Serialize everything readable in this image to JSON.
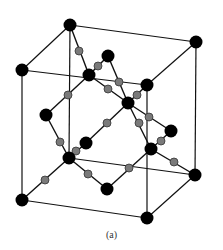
{
  "figure": {
    "caption": "(a)",
    "colors": {
      "background": "#ffffff",
      "edge": "#111111",
      "atom_large": "#000000",
      "atom_small": "#7a7a7a",
      "atom_small_stroke": "#333333"
    },
    "cube_corners": {
      "top_back_left": [
        70,
        25
      ],
      "top_back_right": [
        196,
        42
      ],
      "top_front_left": [
        22,
        70
      ],
      "top_front_right": [
        147,
        85
      ],
      "bottom_back_left": [
        69,
        158
      ],
      "bottom_back_right": [
        195,
        175
      ],
      "bottom_front_left": [
        22,
        200
      ],
      "bottom_front_right": [
        147,
        218
      ]
    },
    "cube_edges": [
      [
        "top_back_left",
        "top_back_right"
      ],
      [
        "top_back_left",
        "top_front_left"
      ],
      [
        "top_back_right",
        "top_front_right"
      ],
      [
        "top_front_left",
        "top_front_right"
      ],
      [
        "bottom_back_left",
        "bottom_back_right"
      ],
      [
        "bottom_front_left",
        "bottom_front_right"
      ],
      [
        "bottom_back_right",
        "bottom_front_right"
      ],
      [
        "top_back_left",
        "bottom_back_left"
      ],
      [
        "top_back_right",
        "bottom_back_right"
      ],
      [
        "top_front_left",
        "bottom_front_left"
      ],
      [
        "top_front_right",
        "bottom_front_right"
      ]
    ],
    "large_atoms": [
      [
        70,
        25
      ],
      [
        196,
        42
      ],
      [
        22,
        70
      ],
      [
        147,
        85
      ],
      [
        22,
        200
      ],
      [
        147,
        218
      ],
      [
        195,
        175
      ],
      [
        69,
        158
      ],
      [
        108,
        56
      ],
      [
        89,
        75
      ],
      [
        46,
        115
      ],
      [
        128,
        103
      ],
      [
        171,
        131
      ],
      [
        86,
        143
      ],
      [
        151,
        149
      ],
      [
        107,
        189
      ]
    ],
    "bonds": [
      {
        "from": [
          70,
          25
        ],
        "to": [
          89,
          75
        ],
        "mid": [
          79,
          51
        ]
      },
      {
        "from": [
          108,
          56
        ],
        "to": [
          89,
          75
        ],
        "mid": [
          98,
          66
        ]
      },
      {
        "from": [
          89,
          75
        ],
        "to": [
          46,
          115
        ],
        "mid": [
          68,
          95
        ]
      },
      {
        "from": [
          89,
          75
        ],
        "to": [
          128,
          103
        ],
        "mid": [
          108,
          89
        ]
      },
      {
        "from": [
          108,
          56
        ],
        "to": [
          128,
          103
        ],
        "mid": [
          119,
          82
        ]
      },
      {
        "from": [
          147,
          85
        ],
        "to": [
          128,
          103
        ],
        "mid": [
          137,
          95
        ]
      },
      {
        "from": [
          128,
          103
        ],
        "to": [
          171,
          131
        ],
        "mid": [
          149,
          117
        ]
      },
      {
        "from": [
          128,
          103
        ],
        "to": [
          151,
          149
        ],
        "mid": [
          139,
          123
        ]
      },
      {
        "from": [
          128,
          103
        ],
        "to": [
          86,
          143
        ],
        "mid": [
          107,
          123
        ]
      },
      {
        "from": [
          46,
          115
        ],
        "to": [
          69,
          158
        ],
        "mid": [
          60,
          142
        ]
      },
      {
        "from": [
          86,
          143
        ],
        "to": [
          69,
          158
        ],
        "mid": [
          76,
          151
        ]
      },
      {
        "from": [
          22,
          200
        ],
        "to": [
          69,
          158
        ],
        "mid": [
          45,
          180
        ]
      },
      {
        "from": [
          69,
          158
        ],
        "to": [
          107,
          189
        ],
        "mid": [
          88,
          174
        ]
      },
      {
        "from": [
          107,
          189
        ],
        "to": [
          151,
          149
        ],
        "mid": [
          129,
          168
        ]
      },
      {
        "from": [
          171,
          131
        ],
        "to": [
          151,
          149
        ],
        "mid": [
          161,
          141
        ]
      },
      {
        "from": [
          151,
          149
        ],
        "to": [
          195,
          175
        ],
        "mid": [
          174,
          162
        ]
      }
    ]
  }
}
